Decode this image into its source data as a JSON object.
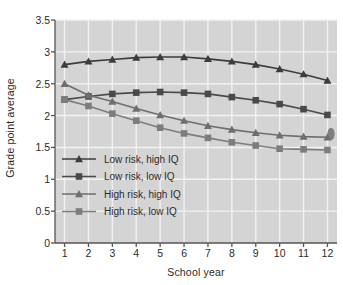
{
  "chart_data": {
    "type": "line",
    "title": "",
    "xlabel": "School year",
    "ylabel": "Grade point average",
    "x": [
      1,
      2,
      3,
      4,
      5,
      6,
      7,
      8,
      9,
      10,
      11,
      12
    ],
    "categories": [
      "1",
      "2",
      "3",
      "4",
      "5",
      "6",
      "7",
      "8",
      "9",
      "10",
      "11",
      "12"
    ],
    "xlim": [
      0.6,
      12.4
    ],
    "ylim": [
      0,
      3.5
    ],
    "yticks": [
      0,
      0.5,
      1,
      1.5,
      2,
      2.5,
      3,
      3.5
    ],
    "ytick_labels": [
      "0",
      "0.5",
      "1",
      "1.5",
      "2",
      "2.5",
      "3",
      "3.5"
    ],
    "grid": true,
    "legend_position": "lower-left-inside",
    "series": [
      {
        "name": "Low risk, high IQ",
        "marker": "triangle",
        "color": "#3c3c3c",
        "values": [
          2.8,
          2.85,
          2.88,
          2.91,
          2.92,
          2.92,
          2.89,
          2.85,
          2.8,
          2.73,
          2.65,
          2.55
        ]
      },
      {
        "name": "Low risk, low IQ",
        "marker": "square",
        "color": "#4a4a4a",
        "values": [
          2.25,
          2.3,
          2.34,
          2.36,
          2.37,
          2.36,
          2.34,
          2.29,
          2.24,
          2.18,
          2.1,
          2.01
        ]
      },
      {
        "name": "High risk, high IQ",
        "marker": "triangle",
        "color": "#6e6e6e",
        "values": [
          2.5,
          2.32,
          2.22,
          2.11,
          2.01,
          1.92,
          1.84,
          1.78,
          1.73,
          1.69,
          1.67,
          1.66
        ]
      },
      {
        "name": "High risk, low IQ",
        "marker": "square",
        "color": "#7d7d7d",
        "values": [
          2.25,
          2.15,
          2.03,
          1.92,
          1.81,
          1.72,
          1.65,
          1.58,
          1.53,
          1.48,
          1.47,
          1.46
        ]
      }
    ]
  },
  "style": {
    "plot_background": "#d4d4d4",
    "figure_background": "#ffffff",
    "gridline_color": "#f2f2f2",
    "axis_color": "#555555",
    "text_color": "#2b2b2b"
  }
}
